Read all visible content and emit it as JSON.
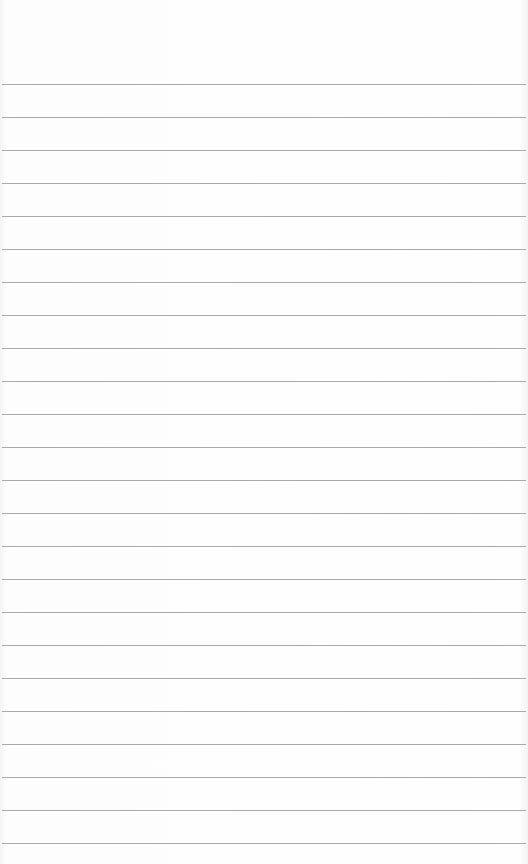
{
  "paper": {
    "type": "lined-notepad",
    "background_color": "#fdfdfd",
    "line_color": "#9a9a9a",
    "first_line_y": 84,
    "line_spacing": 33,
    "line_count": 24
  }
}
